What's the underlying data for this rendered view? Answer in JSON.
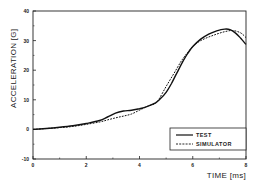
{
  "chart_data": {
    "type": "line",
    "title": "",
    "xlabel": "TIME [ms]",
    "ylabel": "ACCELERATION [G]",
    "xlim": [
      0,
      8
    ],
    "ylim": [
      -10,
      40
    ],
    "xticks": [
      0,
      2,
      4,
      6,
      8
    ],
    "yticks": [
      -10,
      0,
      10,
      20,
      30,
      40
    ],
    "grid": false,
    "legend_position": "lower right",
    "series": [
      {
        "name": "TEST",
        "style": "solid",
        "x": [
          0,
          0.5,
          1.0,
          1.5,
          2.0,
          2.5,
          2.8,
          3.1,
          3.4,
          3.7,
          4.0,
          4.3,
          4.6,
          4.8,
          5.0,
          5.2,
          5.4,
          5.6,
          5.8,
          6.0,
          6.3,
          6.6,
          6.9,
          7.2,
          7.4,
          7.6,
          7.8,
          8.0
        ],
        "y": [
          0,
          0.3,
          0.7,
          1.2,
          2.0,
          3.0,
          4.2,
          5.5,
          6.2,
          6.5,
          7.0,
          7.8,
          9.0,
          10.5,
          12.5,
          15.5,
          19.0,
          22.5,
          25.5,
          28.0,
          30.5,
          32.2,
          33.3,
          33.9,
          33.7,
          32.6,
          30.8,
          28.7
        ]
      },
      {
        "name": "SIMULATOR",
        "style": "dashed",
        "x": [
          0,
          0.5,
          1.0,
          1.5,
          2.0,
          2.5,
          2.8,
          3.1,
          3.4,
          3.7,
          4.0,
          4.3,
          4.6,
          4.75,
          5.0,
          5.3,
          5.6,
          5.9,
          6.1,
          6.3,
          6.6,
          6.9,
          7.2,
          7.5,
          7.8,
          8.0
        ],
        "y": [
          0,
          0.3,
          0.6,
          1.0,
          1.7,
          2.5,
          3.2,
          3.9,
          4.5,
          5.2,
          6.5,
          7.8,
          8.8,
          10.5,
          14.5,
          19.0,
          23.5,
          27.0,
          28.8,
          30.0,
          31.2,
          32.2,
          33.0,
          33.4,
          32.6,
          31.0
        ]
      }
    ]
  }
}
